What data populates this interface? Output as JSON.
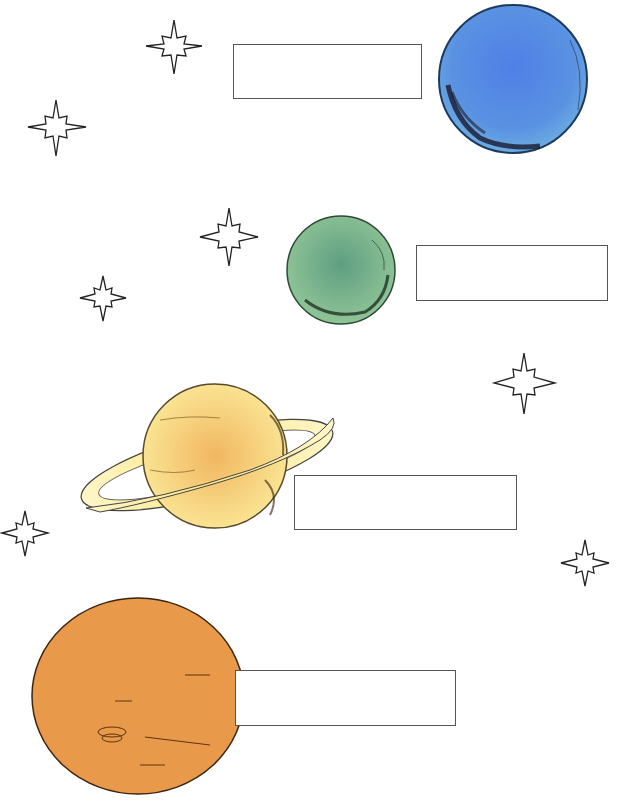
{
  "worksheet": {
    "type": "planet labeling worksheet",
    "planets": [
      {
        "id": "blue-planet",
        "color": "#5b8fe0",
        "edge": "#2f5f9a",
        "label_box_value": ""
      },
      {
        "id": "green-planet",
        "color": "#7fb88f",
        "edge": "#3e6e4c",
        "label_box_value": ""
      },
      {
        "id": "ringed-yellow-planet",
        "color": "#f5d77e",
        "edge": "#7a5a20",
        "label_box_value": ""
      },
      {
        "id": "orange-planet",
        "color": "#e89a4a",
        "edge": "#3a2410",
        "label_box_value": ""
      }
    ],
    "stars": [
      {
        "x": 174,
        "y": 46
      },
      {
        "x": 56,
        "y": 127
      },
      {
        "x": 229,
        "y": 237
      },
      {
        "x": 103,
        "y": 298
      },
      {
        "x": 524,
        "y": 383
      },
      {
        "x": 25,
        "y": 533
      },
      {
        "x": 585,
        "y": 563
      }
    ]
  }
}
